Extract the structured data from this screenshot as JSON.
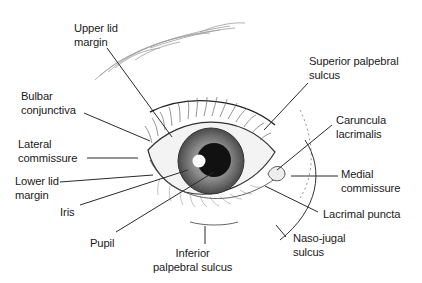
{
  "diagram": {
    "colors": {
      "background": "#ffffff",
      "text": "#1a1a1a",
      "leader_line": "#2a2a2a",
      "iris_outer": "#6e6e6e",
      "iris_inner": "#9a9a9a",
      "pupil": "#111111",
      "sclera": "#f2f2f2"
    },
    "labels": [
      {
        "id": "upper-lid-margin",
        "text": "Upper lid\nmargin",
        "x": 74,
        "y": 22
      },
      {
        "id": "superior-palpebral-sulcus",
        "text": "Superior palpebral\nsulcus",
        "x": 309,
        "y": 55
      },
      {
        "id": "bulbar-conjunctiva",
        "text": "Bulbar\nconjunctiva",
        "x": 21,
        "y": 90
      },
      {
        "id": "caruncula-lacrimalis",
        "text": "Caruncula\nlacrimalis",
        "x": 336,
        "y": 114
      },
      {
        "id": "lateral-commissure",
        "text": "Lateral\ncommissure",
        "x": 18,
        "y": 138
      },
      {
        "id": "medial-commissure",
        "text": "Medial\ncommissure",
        "x": 341,
        "y": 168
      },
      {
        "id": "lower-lid-margin",
        "text": "Lower lid\nmargin",
        "x": 15,
        "y": 175
      },
      {
        "id": "iris",
        "text": "Iris",
        "x": 60,
        "y": 206
      },
      {
        "id": "lacrimal-puncta",
        "text": "Lacrimal puncta",
        "x": 323,
        "y": 208
      },
      {
        "id": "pupil",
        "text": "Pupil",
        "x": 90,
        "y": 237
      },
      {
        "id": "naso-jugal-sulcus",
        "text": "Naso-jugal\nsulcus",
        "x": 293,
        "y": 232
      },
      {
        "id": "inferior-palpebral-sulcus",
        "text": "Inferior\npalpebral sulcus",
        "x": 153,
        "y": 247
      }
    ]
  }
}
